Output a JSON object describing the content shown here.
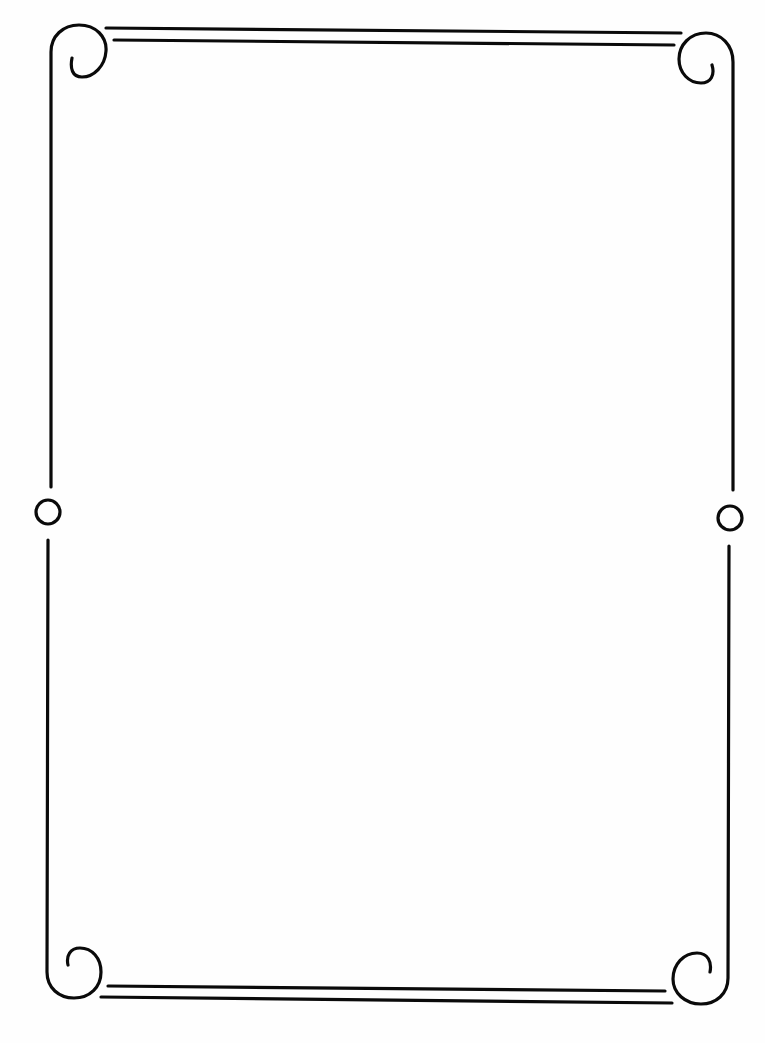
{
  "page": {
    "type": "decorative-border-frame",
    "background": "#fefefe",
    "stroke_color": "#0a0a0a",
    "stroke_width": 3.2
  },
  "frame": {
    "top_lines": [
      {
        "y1": 28,
        "y2": 33,
        "x1": 106,
        "x2": 681
      },
      {
        "y1": 40,
        "y2": 45,
        "x1": 114,
        "x2": 674
      }
    ],
    "bottom_lines": [
      {
        "y1": 986,
        "y2": 991,
        "x1": 108,
        "x2": 665
      },
      {
        "y1": 997,
        "y2": 1003,
        "x1": 101,
        "x2": 672
      }
    ],
    "left_side": {
      "x_top": 51,
      "x_bottom": 47,
      "circle": {
        "cx": 48,
        "cy": 512,
        "r": 12
      }
    },
    "right_side": {
      "x_top": 733,
      "x_bottom": 728,
      "circle": {
        "cx": 730,
        "cy": 518,
        "r": 12
      }
    },
    "corners": [
      "top-left-scroll",
      "top-right-scroll",
      "bottom-left-scroll",
      "bottom-right-scroll"
    ]
  }
}
